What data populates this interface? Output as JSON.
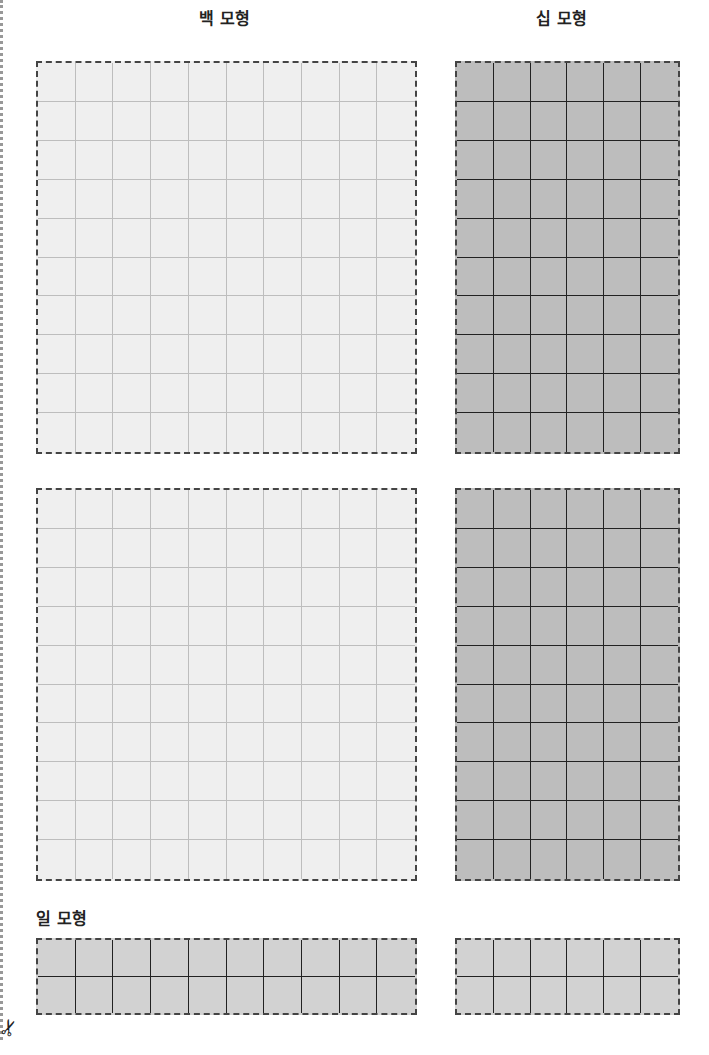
{
  "labels": {
    "hundred": "백 모형",
    "ten": "십 모형",
    "one": "일 모형"
  },
  "icons": {
    "scissors": "✂"
  },
  "blocks": [
    {
      "name": "hundred-block-1",
      "cols": 10,
      "rows": 10,
      "x": 36,
      "y": 61,
      "w": 381,
      "h": 393,
      "style": "light"
    },
    {
      "name": "ten-block-1",
      "cols": 6,
      "rows": 10,
      "x": 455,
      "y": 61,
      "w": 225,
      "h": 393,
      "style": "dark"
    },
    {
      "name": "hundred-block-2",
      "cols": 10,
      "rows": 10,
      "x": 36,
      "y": 488,
      "w": 381,
      "h": 393,
      "style": "light"
    },
    {
      "name": "ten-block-2",
      "cols": 6,
      "rows": 10,
      "x": 455,
      "y": 488,
      "w": 225,
      "h": 393,
      "style": "dark"
    },
    {
      "name": "one-block-1",
      "cols": 10,
      "rows": 2,
      "x": 36,
      "y": 938,
      "w": 381,
      "h": 77,
      "style": "mid"
    },
    {
      "name": "one-block-2",
      "cols": 6,
      "rows": 2,
      "x": 455,
      "y": 938,
      "w": 225,
      "h": 77,
      "style": "mid"
    }
  ],
  "colors": {
    "hundred_fill": "#efefef",
    "ten_fill": "#bdbdbd",
    "one_fill": "#d2d2d2",
    "dashed_border": "#444444"
  }
}
